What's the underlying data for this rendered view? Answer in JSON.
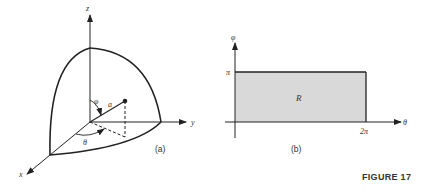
{
  "figure": {
    "label": "FIGURE 17",
    "panel_a": {
      "caption": "(a)",
      "axes": {
        "x": "x",
        "y": "y",
        "z": "z"
      },
      "labels": {
        "phi": "φ",
        "theta": "θ",
        "radius": "a"
      }
    },
    "panel_b": {
      "caption": "(b)",
      "axes": {
        "vertical": "φ",
        "horizontal": "θ"
      },
      "ticks": {
        "vertical_top": "π",
        "horizontal_right": "2π"
      },
      "region_label": "R",
      "region_fill": "#d9d9d9"
    }
  }
}
